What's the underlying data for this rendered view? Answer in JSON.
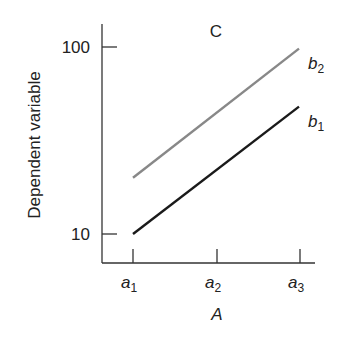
{
  "chart_data": {
    "type": "line",
    "title": "C",
    "xlabel": "A",
    "ylabel": "Dependent variable",
    "yscale": "log",
    "ylim": [
      8,
      120
    ],
    "yticks": [
      10,
      100
    ],
    "ytick_labels": [
      "10",
      "100"
    ],
    "categories": [
      "a1",
      "a2",
      "a3"
    ],
    "category_labels": [
      {
        "base": "a",
        "sub": "1"
      },
      {
        "base": "a",
        "sub": "2"
      },
      {
        "base": "a",
        "sub": "3"
      }
    ],
    "series": [
      {
        "name": "b2",
        "label_base": "b",
        "label_sub": "2",
        "color": "#888888",
        "values": [
          20,
          44,
          98
        ]
      },
      {
        "name": "b1",
        "label_base": "b",
        "label_sub": "1",
        "color": "#1a1a1a",
        "values": [
          10,
          22,
          48
        ]
      }
    ],
    "grid": false,
    "legend_position": "inline-right"
  }
}
